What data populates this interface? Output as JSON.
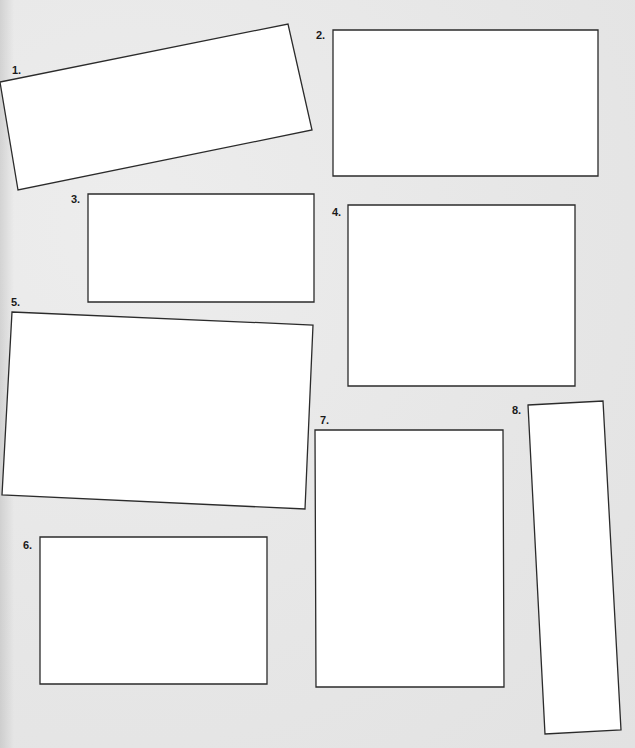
{
  "worksheet": {
    "boxes": [
      {
        "number": 1,
        "label": "1.",
        "points": "0,82 288,24 312,130 18,190",
        "label_x": 12,
        "label_y": 74
      },
      {
        "number": 2,
        "label": "2.",
        "points": "333,30 598,30 598,176 333,176",
        "label_x": 316,
        "label_y": 39
      },
      {
        "number": 3,
        "label": "3.",
        "points": "88,194 314,194 314,302 88,302",
        "label_x": 71,
        "label_y": 203
      },
      {
        "number": 4,
        "label": "4.",
        "points": "348,205 575,205 575,386 348,386",
        "label_x": 332,
        "label_y": 216
      },
      {
        "number": 5,
        "label": "5.",
        "points": "12,312 313,325 305,509 2,495",
        "label_x": 11,
        "label_y": 306
      },
      {
        "number": 6,
        "label": "6.",
        "points": "40,537 267,537 267,684 40,684",
        "label_x": 23,
        "label_y": 549
      },
      {
        "number": 7,
        "label": "7.",
        "points": "315,430 503,430 504,687 316,687",
        "label_x": 320,
        "label_y": 424
      },
      {
        "number": 8,
        "label": "8.",
        "points": "528,405 603,401 621,730 545,734",
        "label_x": 512,
        "label_y": 414
      }
    ]
  }
}
